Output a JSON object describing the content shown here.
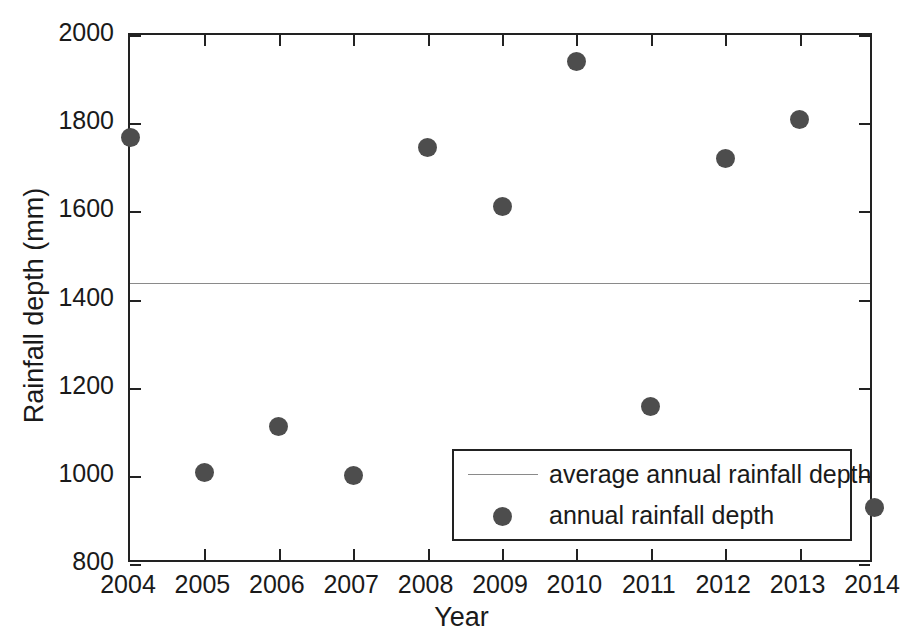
{
  "chart_data": {
    "type": "scatter",
    "title": "",
    "xlabel": "Year",
    "ylabel": "Rainfall depth (mm)",
    "x": [
      2004,
      2005,
      2006,
      2007,
      2008,
      2009,
      2010,
      2011,
      2012,
      2013,
      2014
    ],
    "categories": [
      "2004",
      "2005",
      "2006",
      "2007",
      "2008",
      "2009",
      "2010",
      "2011",
      "2012",
      "2013",
      "2014"
    ],
    "values": [
      1767,
      1007,
      1113,
      1000,
      1745,
      1612,
      1941,
      1158,
      1720,
      1808,
      929
    ],
    "series": [
      {
        "name": "annual rainfall depth",
        "type": "scatter",
        "marker": "filled-circle",
        "color": "#4d4d4d",
        "x": [
          2004,
          2005,
          2006,
          2007,
          2008,
          2009,
          2010,
          2011,
          2012,
          2013,
          2014
        ],
        "values": [
          1767,
          1007,
          1113,
          1000,
          1745,
          1612,
          1941,
          1158,
          1720,
          1808,
          929
        ]
      },
      {
        "name": "average annual rainfall depth",
        "type": "line",
        "color": "#8a8a8a",
        "constant_value": 1437
      }
    ],
    "xlim": [
      2004,
      2014
    ],
    "ylim": [
      800,
      2000
    ],
    "xticks": [
      2004,
      2005,
      2006,
      2007,
      2008,
      2009,
      2010,
      2011,
      2012,
      2013,
      2014
    ],
    "xticklabels": [
      "2004",
      "2005",
      "2006",
      "2007",
      "2008",
      "2009",
      "2010",
      "2011",
      "2012",
      "2013",
      "2014"
    ],
    "yticks": [
      800,
      1000,
      1200,
      1400,
      1600,
      1800,
      2000
    ],
    "yticklabels": [
      "800",
      "1000",
      "1200",
      "1400",
      "1600",
      "1800",
      "2000"
    ],
    "grid": false,
    "legend": {
      "position": "bottom-right-inside",
      "entries": [
        {
          "label": "average annual rainfall depth",
          "key": "line",
          "color": "#8a8a8a"
        },
        {
          "label": "annual rainfall depth",
          "key": "filled-circle",
          "color": "#4d4d4d"
        }
      ]
    },
    "colors": {
      "axis": "#222222",
      "text": "#1a1a1a",
      "marker": "#4d4d4d",
      "average_line": "#8a8a8a",
      "background": "#ffffff"
    }
  }
}
